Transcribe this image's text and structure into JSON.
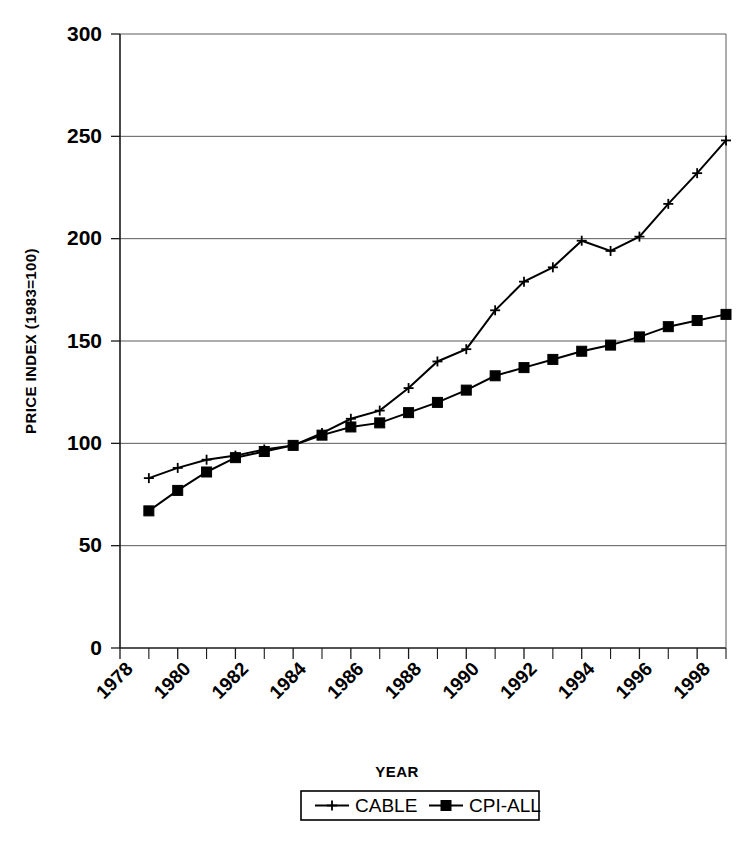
{
  "chart_data": {
    "type": "line",
    "title": "",
    "xlabel": "YEAR",
    "ylabel": "PRICE INDEX (1983=100)",
    "xlim": [
      1978,
      1999
    ],
    "ylim": [
      0,
      300
    ],
    "grid": true,
    "legend_position": "bottom",
    "x": [
      1979,
      1980,
      1981,
      1982,
      1983,
      1984,
      1985,
      1986,
      1987,
      1988,
      1989,
      1990,
      1991,
      1992,
      1993,
      1994,
      1995,
      1996,
      1997,
      1998,
      1999
    ],
    "series": [
      {
        "name": "CABLE",
        "marker": "plus",
        "values": [
          83,
          88,
          92,
          94,
          97,
          99,
          105,
          112,
          116,
          127,
          140,
          146,
          165,
          179,
          186,
          199,
          194,
          201,
          217,
          232,
          248
        ]
      },
      {
        "name": "CPI-ALL",
        "marker": "square",
        "values": [
          67,
          77,
          86,
          93,
          96,
          99,
          104,
          108,
          110,
          115,
          120,
          126,
          133,
          137,
          141,
          145,
          148,
          152,
          157,
          160,
          163
        ]
      }
    ],
    "y_ticks": [
      0,
      50,
      100,
      150,
      200,
      250,
      300
    ],
    "y_tick_labels": [
      "0",
      "50",
      "100",
      "150",
      "200",
      "250",
      "300"
    ],
    "x_ticks": [
      1978,
      1980,
      1982,
      1984,
      1986,
      1988,
      1990,
      1992,
      1994,
      1996,
      1998
    ],
    "x_tick_labels": [
      "1978",
      "1980",
      "1982",
      "1984",
      "1986",
      "1988",
      "1990",
      "1992",
      "1994",
      "1996",
      "1998"
    ],
    "x_minor_ticks": [
      1979,
      1981,
      1983,
      1985,
      1987,
      1989,
      1991,
      1993,
      1995,
      1997,
      1999
    ],
    "colors": {
      "line": "#000000",
      "grid": "#5a5a5a",
      "axis": "#1a1a1a",
      "background": "#ffffff"
    }
  },
  "legend": {
    "entries": [
      {
        "label": "CABLE",
        "marker": "plus-marker-icon"
      },
      {
        "label": "CPI-ALL",
        "marker": "square-marker-icon"
      }
    ]
  },
  "axes": {
    "y_title": "PRICE INDEX (1983=100)",
    "x_title": "YEAR"
  }
}
